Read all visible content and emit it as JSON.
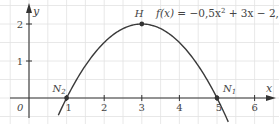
{
  "chart_data": {
    "type": "line",
    "title": "",
    "function_label": "f(x) = −0,5x² + 3x − 2,5",
    "function_parts": {
      "f": "f(x)",
      "eq": " = −0,5x",
      "sup": "2",
      "rest": " + 3x − 2,5"
    },
    "coefficients": {
      "a": -0.5,
      "b": 3,
      "c": -2.5
    },
    "xlabel": "x",
    "ylabel": "y",
    "xlim": [
      -0.75,
      6.5
    ],
    "ylim": [
      -0.65,
      2.6
    ],
    "x_ticks": [
      1,
      2,
      3,
      4,
      5,
      6
    ],
    "y_ticks": [
      1,
      2
    ],
    "origin_label": "0",
    "grid": true,
    "grid_step": 0.5,
    "curve_domain": [
      0.78,
      5.3
    ],
    "points": [
      {
        "name": "N2",
        "label": "N",
        "sub": "2",
        "x": 1,
        "y": 0
      },
      {
        "name": "H",
        "label": "H",
        "sub": "",
        "x": 3,
        "y": 2
      },
      {
        "name": "N1",
        "label": "N",
        "sub": "1",
        "x": 5,
        "y": 0
      }
    ],
    "colors": {
      "curve": "#3a3a3a",
      "axis": "#333333",
      "grid": "#e2e2e2",
      "text": "#444444"
    }
  }
}
